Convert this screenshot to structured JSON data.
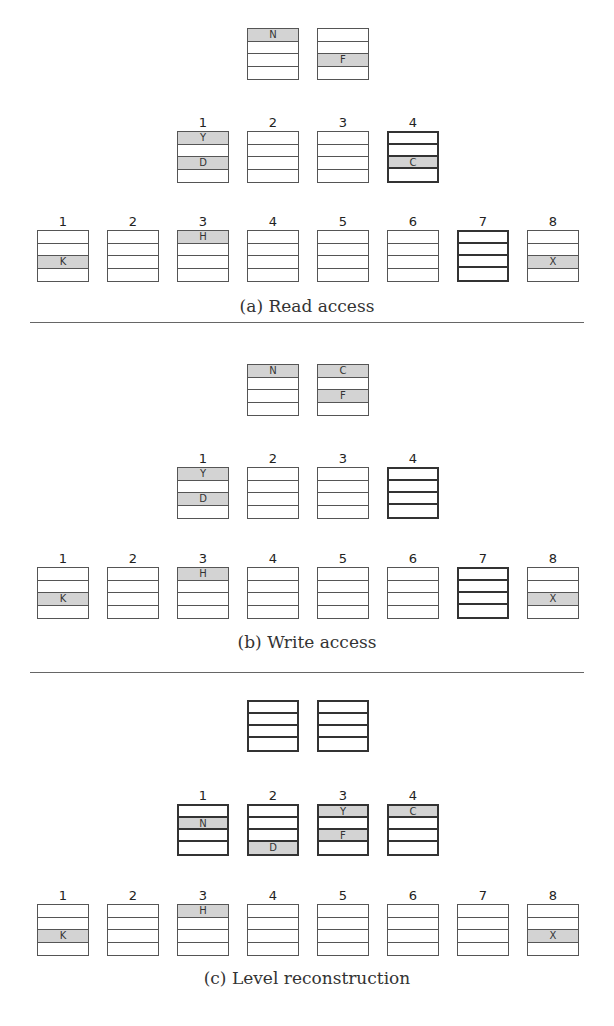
{
  "panels": [
    {
      "caption": "(a) Read access",
      "top": 0,
      "levels": [
        {
          "y": 28,
          "show_numbers": false,
          "buckets": [
            {
              "x": 247,
              "bold": false,
              "slots": [
                "N",
                null,
                null,
                null
              ]
            },
            {
              "x": 317,
              "bold": false,
              "slots": [
                null,
                null,
                "F",
                null
              ]
            }
          ]
        },
        {
          "y": 131,
          "show_numbers": true,
          "buckets": [
            {
              "x": 177,
              "num": "1",
              "bold": false,
              "slots": [
                "Y",
                null,
                "D",
                null
              ]
            },
            {
              "x": 247,
              "num": "2",
              "bold": false,
              "slots": [
                null,
                null,
                null,
                null
              ]
            },
            {
              "x": 317,
              "num": "3",
              "bold": false,
              "slots": [
                null,
                null,
                null,
                null
              ]
            },
            {
              "x": 387,
              "num": "4",
              "bold": true,
              "slots": [
                null,
                null,
                "C",
                null
              ]
            }
          ]
        },
        {
          "y": 230,
          "show_numbers": true,
          "buckets": [
            {
              "x": 37,
              "num": "1",
              "bold": false,
              "slots": [
                null,
                null,
                "K",
                null
              ]
            },
            {
              "x": 107,
              "num": "2",
              "bold": false,
              "slots": [
                null,
                null,
                null,
                null
              ]
            },
            {
              "x": 177,
              "num": "3",
              "bold": false,
              "slots": [
                "H",
                null,
                null,
                null
              ]
            },
            {
              "x": 247,
              "num": "4",
              "bold": false,
              "slots": [
                null,
                null,
                null,
                null
              ]
            },
            {
              "x": 317,
              "num": "5",
              "bold": false,
              "slots": [
                null,
                null,
                null,
                null
              ]
            },
            {
              "x": 387,
              "num": "6",
              "bold": false,
              "slots": [
                null,
                null,
                null,
                null
              ]
            },
            {
              "x": 457,
              "num": "7",
              "bold": true,
              "slots": [
                null,
                null,
                null,
                null
              ]
            },
            {
              "x": 527,
              "num": "8",
              "bold": false,
              "slots": [
                null,
                null,
                "X",
                null
              ]
            }
          ]
        }
      ],
      "caption_y": 296
    },
    {
      "caption": "(b) Write access",
      "top": 0,
      "levels": [
        {
          "y": 364,
          "show_numbers": false,
          "buckets": [
            {
              "x": 247,
              "bold": false,
              "slots": [
                "N",
                null,
                null,
                null
              ]
            },
            {
              "x": 317,
              "bold": false,
              "slots": [
                "C",
                null,
                "F",
                null
              ]
            }
          ]
        },
        {
          "y": 467,
          "show_numbers": true,
          "buckets": [
            {
              "x": 177,
              "num": "1",
              "bold": false,
              "slots": [
                "Y",
                null,
                "D",
                null
              ]
            },
            {
              "x": 247,
              "num": "2",
              "bold": false,
              "slots": [
                null,
                null,
                null,
                null
              ]
            },
            {
              "x": 317,
              "num": "3",
              "bold": false,
              "slots": [
                null,
                null,
                null,
                null
              ]
            },
            {
              "x": 387,
              "num": "4",
              "bold": true,
              "slots": [
                null,
                null,
                null,
                null
              ]
            }
          ]
        },
        {
          "y": 567,
          "show_numbers": true,
          "buckets": [
            {
              "x": 37,
              "num": "1",
              "bold": false,
              "slots": [
                null,
                null,
                "K",
                null
              ]
            },
            {
              "x": 107,
              "num": "2",
              "bold": false,
              "slots": [
                null,
                null,
                null,
                null
              ]
            },
            {
              "x": 177,
              "num": "3",
              "bold": false,
              "slots": [
                "H",
                null,
                null,
                null
              ]
            },
            {
              "x": 247,
              "num": "4",
              "bold": false,
              "slots": [
                null,
                null,
                null,
                null
              ]
            },
            {
              "x": 317,
              "num": "5",
              "bold": false,
              "slots": [
                null,
                null,
                null,
                null
              ]
            },
            {
              "x": 387,
              "num": "6",
              "bold": false,
              "slots": [
                null,
                null,
                null,
                null
              ]
            },
            {
              "x": 457,
              "num": "7",
              "bold": true,
              "slots": [
                null,
                null,
                null,
                null
              ]
            },
            {
              "x": 527,
              "num": "8",
              "bold": false,
              "slots": [
                null,
                null,
                "X",
                null
              ]
            }
          ]
        }
      ],
      "caption_y": 632
    },
    {
      "caption": "(c) Level reconstruction",
      "top": 0,
      "levels": [
        {
          "y": 700,
          "show_numbers": false,
          "buckets": [
            {
              "x": 247,
              "bold": true,
              "slots": [
                null,
                null,
                null,
                null
              ]
            },
            {
              "x": 317,
              "bold": true,
              "slots": [
                null,
                null,
                null,
                null
              ]
            }
          ]
        },
        {
          "y": 804,
          "show_numbers": true,
          "buckets": [
            {
              "x": 177,
              "num": "1",
              "bold": true,
              "slots": [
                null,
                "N",
                null,
                null
              ]
            },
            {
              "x": 247,
              "num": "2",
              "bold": true,
              "slots": [
                null,
                null,
                null,
                "D"
              ]
            },
            {
              "x": 317,
              "num": "3",
              "bold": true,
              "slots": [
                "Y",
                null,
                "F",
                null
              ]
            },
            {
              "x": 387,
              "num": "4",
              "bold": true,
              "slots": [
                "C",
                null,
                null,
                null
              ]
            }
          ]
        },
        {
          "y": 904,
          "show_numbers": true,
          "buckets": [
            {
              "x": 37,
              "num": "1",
              "bold": false,
              "slots": [
                null,
                null,
                "K",
                null
              ]
            },
            {
              "x": 107,
              "num": "2",
              "bold": false,
              "slots": [
                null,
                null,
                null,
                null
              ]
            },
            {
              "x": 177,
              "num": "3",
              "bold": false,
              "slots": [
                "H",
                null,
                null,
                null
              ]
            },
            {
              "x": 247,
              "num": "4",
              "bold": false,
              "slots": [
                null,
                null,
                null,
                null
              ]
            },
            {
              "x": 317,
              "num": "5",
              "bold": false,
              "slots": [
                null,
                null,
                null,
                null
              ]
            },
            {
              "x": 387,
              "num": "6",
              "bold": false,
              "slots": [
                null,
                null,
                null,
                null
              ]
            },
            {
              "x": 457,
              "num": "7",
              "bold": false,
              "slots": [
                null,
                null,
                null,
                null
              ]
            },
            {
              "x": 527,
              "num": "8",
              "bold": false,
              "slots": [
                null,
                null,
                "X",
                null
              ]
            }
          ]
        }
      ],
      "caption_y": 968
    }
  ],
  "separators": [
    322,
    672
  ],
  "colors": {
    "filled_slot": "#d3d3d3",
    "border": "#555555"
  }
}
